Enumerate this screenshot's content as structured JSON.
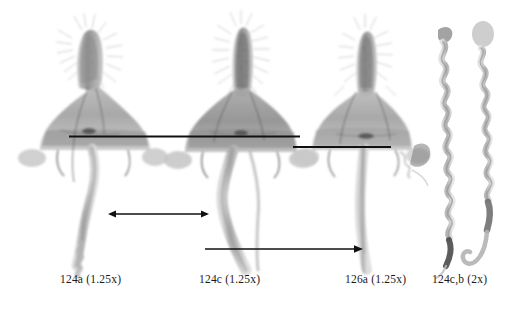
{
  "figure": {
    "background_color": "#ffffff",
    "ink_color": "#111111",
    "width": 517,
    "height": 309
  },
  "captions": [
    {
      "id": "caption-124a",
      "text": "124a (1.25x)",
      "specimen": "124a",
      "magnification": "1.25x"
    },
    {
      "id": "caption-124c",
      "text": "124c (1.25x)",
      "specimen": "124c",
      "magnification": "1.25x"
    },
    {
      "id": "caption-126a",
      "text": "126a (1.25x)",
      "specimen": "126a",
      "magnification": "1.25x"
    },
    {
      "id": "caption-124cb",
      "text": "124c,b (2x)",
      "specimen": "124c,b",
      "magnification": "2x"
    }
  ],
  "panels": [
    {
      "name": "panel-124a",
      "label": "124a (1.25x)",
      "type": "genitalia-capsule"
    },
    {
      "name": "panel-124c",
      "label": "124c (1.25x)",
      "type": "genitalia-capsule"
    },
    {
      "name": "panel-126a",
      "label": "126a (1.25x)",
      "type": "genitalia-capsule"
    },
    {
      "name": "panel-124cb",
      "label": "124c,b (2x)",
      "type": "coiled-aedeagus-pair"
    }
  ],
  "annotations": [
    {
      "name": "reference-line-upper",
      "kind": "horizontal-rule",
      "x1": 69,
      "y1": 136,
      "x2": 300,
      "y2": 136
    },
    {
      "name": "reference-line-lower",
      "kind": "horizontal-rule",
      "x1": 293,
      "y1": 147,
      "x2": 391,
      "y2": 147
    },
    {
      "name": "measure-arrow-double",
      "kind": "double-headed-arrow",
      "x1": 108,
      "y1": 214,
      "x2": 209,
      "y2": 214
    },
    {
      "name": "measure-arrow-single",
      "kind": "single-headed-arrow",
      "x1": 205,
      "y1": 249,
      "x2": 363,
      "y2": 249
    }
  ]
}
